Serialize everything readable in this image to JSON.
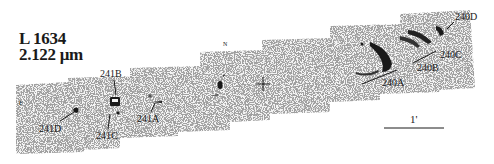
{
  "figure": {
    "object_name": "L 1634",
    "wavelength": "2.122 μm",
    "orientation": {
      "north": "N",
      "east": "E"
    },
    "scale_bar": {
      "label": "1'"
    },
    "center_marker": "+",
    "knot_labels": {
      "k241A": "241A",
      "k241B": "241B",
      "k241C": "241C",
      "k241D": "241D",
      "k240A": "240A",
      "k240B": "240B",
      "k240C": "240C",
      "k240D": "240D"
    },
    "colors": {
      "background": "#ffffff",
      "ink": "#1a1a1a",
      "noise": "#8a8a8a"
    }
  }
}
